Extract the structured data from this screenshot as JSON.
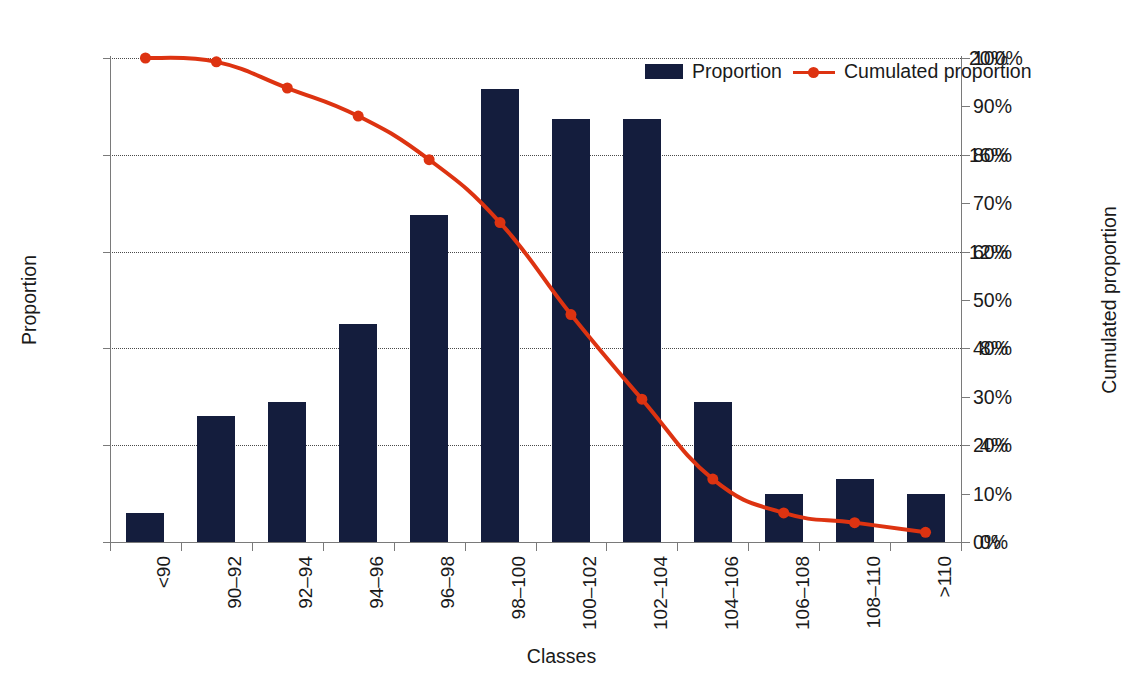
{
  "chart_data": {
    "type": "bar",
    "title": "",
    "xlabel": "Classes",
    "ylabel": "Proportion",
    "y2label": "Cumulated proportion",
    "grid": true,
    "legend_position": "top-right",
    "categories": [
      "<90",
      "90–92",
      "92–94",
      "94–96",
      "96–98",
      "98–100",
      "100–102",
      "102–104",
      "104–106",
      "106–108",
      "108–110",
      ">110"
    ],
    "ylim": [
      0,
      20
    ],
    "yticks": [
      "0%",
      "4%",
      "8%",
      "12%",
      "16%",
      "20%"
    ],
    "ytick_values": [
      0,
      4,
      8,
      12,
      16,
      20
    ],
    "y2lim": [
      0,
      100
    ],
    "y2ticks": [
      "0%",
      "10%",
      "20%",
      "30%",
      "40%",
      "50%",
      "60%",
      "70%",
      "80%",
      "90%",
      "100%"
    ],
    "y2tick_values": [
      0,
      10,
      20,
      30,
      40,
      50,
      60,
      70,
      80,
      90,
      100
    ],
    "series": [
      {
        "name": "Proportion",
        "type": "bar",
        "axis": "left",
        "color": "#141d3d",
        "values": [
          1.2,
          5.2,
          5.8,
          9.0,
          13.5,
          18.7,
          17.5,
          17.5,
          5.8,
          2.0,
          2.6,
          2.0
        ]
      },
      {
        "name": "Cumulated proportion",
        "type": "line",
        "axis": "right",
        "color": "#dd3311",
        "values": [
          100,
          99.2,
          93.8,
          88.0,
          79.0,
          66.0,
          47.0,
          29.5,
          13.0,
          6.0,
          4.0,
          2.0
        ]
      }
    ]
  },
  "legend": {
    "items": [
      {
        "label": "Proportion",
        "color": "#141d3d",
        "marker": "bar-swatch"
      },
      {
        "label": "Cumulated proportion",
        "color": "#dd3311",
        "marker": "line-swatch"
      }
    ]
  }
}
